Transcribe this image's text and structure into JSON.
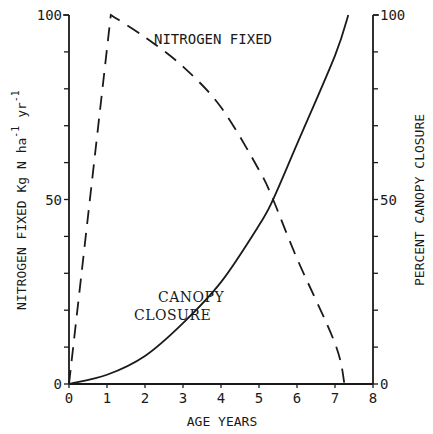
{
  "chart_data": {
    "type": "line",
    "title": "",
    "xlabel": "AGE YEARS",
    "ylabel_left": "NITROGEN FIXED Kg N ha-1 yr-1",
    "ylabel_left_parts": [
      "NITROGEN FIXED Kg N ha",
      "-1",
      " yr",
      "-1"
    ],
    "ylabel_right": "PERCENT CANOPY CLOSURE",
    "xlim": [
      0,
      8
    ],
    "ylim_left": [
      0,
      100
    ],
    "ylim_right": [
      0,
      100
    ],
    "x_ticks": [
      "0",
      "1",
      "2",
      "3",
      "4",
      "5",
      "6",
      "7",
      "8"
    ],
    "y_left_tick_labels": [
      "0",
      "50",
      "100"
    ],
    "y_right_tick_labels": [
      "0",
      "50",
      "100"
    ],
    "y_minor_tick_step": 10,
    "grid": false,
    "legend": "inline annotations",
    "annotations": [
      {
        "text": "NITROGEN FIXED",
        "x": 4.3,
        "y": 93
      },
      {
        "text": "CANOPY",
        "x": 2.6,
        "y": 26
      },
      {
        "text": "CLOSURE",
        "x": 2.4,
        "y": 21
      }
    ],
    "series": [
      {
        "name": "Nitrogen fixed",
        "axis": "left",
        "style": "dashed",
        "x": [
          0,
          1.1,
          2,
          3,
          4,
          5,
          5.37,
          6,
          7,
          7.25
        ],
        "y": [
          0,
          100,
          94,
          86,
          75,
          58,
          50,
          34,
          11,
          0
        ]
      },
      {
        "name": "Canopy closure",
        "axis": "right",
        "style": "solid",
        "x": [
          0,
          1,
          2,
          3,
          4,
          5,
          5.37,
          6,
          7,
          7.35
        ],
        "y": [
          0,
          2.5,
          7.6,
          16.5,
          27.6,
          43,
          50,
          65,
          89,
          100
        ]
      }
    ]
  },
  "colors": {
    "line": "#1a1a1a",
    "background": "#ffffff"
  }
}
